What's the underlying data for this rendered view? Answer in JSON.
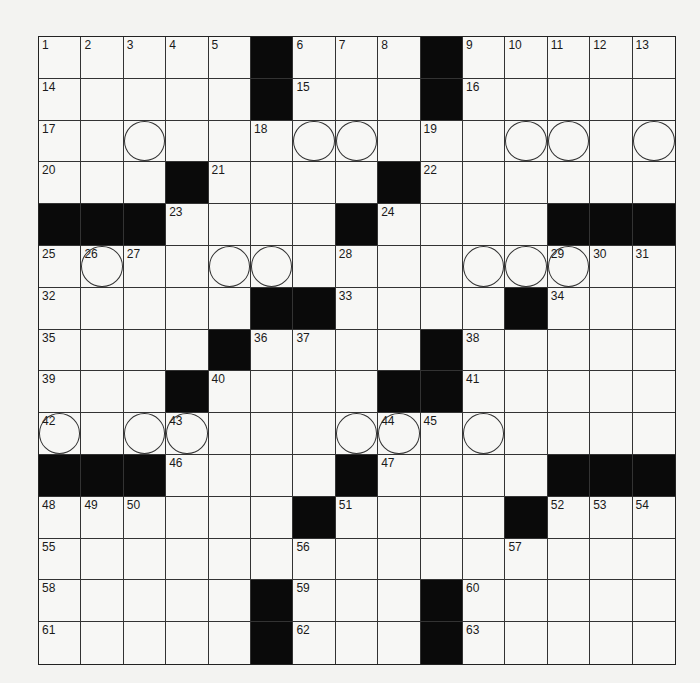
{
  "puzzle": {
    "rows": 15,
    "cols": 15,
    "colors": {
      "black": "#0a0a0a",
      "white": "#f7f7f5",
      "line": "#333333"
    },
    "grid": [
      "1 2 3 4 5 # 6 7 8 # 9 10 11 12 13",
      "14 . . . . # 15 . . # 16 . . . .",
      "17 . . . . 18 . . . 19 . . . . .",
      "20 . . # 21 . . . # 22 . . . . .",
      "# # # 23 . . . # 24 . . . # # #",
      "25 26 27 . . . . 28 . . . . 29 30 31",
      "32 . . . . # # 33 . . . # 34 . .",
      "35 . . . # 36 37 . . # 38 . . . .",
      "39 . . # 40 . . . # # 41 . . . .",
      "42 . . 43 . . . . 44 45 . . . . .",
      "# # # 46 . . . # 47 . . . # # #",
      "48 49 50 . . . # 51 . . . # 52 53 54",
      "55 . . . . . 56 . . . . 57 . . .",
      "58 . . . . # 59 . . # 60 . . . .",
      "61 . . . . # 62 . . # 63 . . . ."
    ],
    "circles": [
      [
        2,
        2
      ],
      [
        2,
        6
      ],
      [
        2,
        7
      ],
      [
        2,
        11
      ],
      [
        2,
        12
      ],
      [
        2,
        14
      ],
      [
        5,
        1
      ],
      [
        5,
        4
      ],
      [
        5,
        5
      ],
      [
        5,
        10
      ],
      [
        5,
        11
      ],
      [
        5,
        12
      ],
      [
        9,
        0
      ],
      [
        9,
        2
      ],
      [
        9,
        3
      ],
      [
        9,
        7
      ],
      [
        9,
        8
      ],
      [
        9,
        10
      ]
    ]
  }
}
